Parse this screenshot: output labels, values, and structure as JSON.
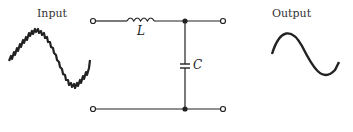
{
  "diagram": {
    "type": "LC low-pass filter circuit",
    "input_label": "Input",
    "output_label": "Output",
    "inductor_label": "L",
    "capacitor_label": "C",
    "input_waveform": "noisy sine wave",
    "output_waveform": "clean sine wave",
    "colors": {
      "line": "#222222",
      "background": "#ffffff"
    }
  }
}
